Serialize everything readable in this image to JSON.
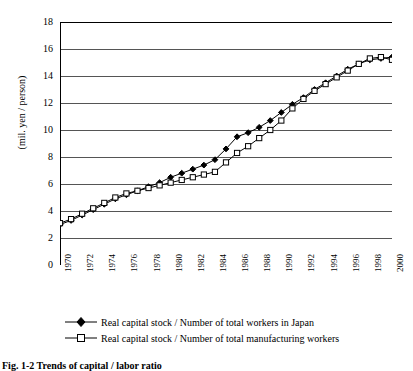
{
  "figure": {
    "caption": "Fig. 1-2  Trends of capital / labor ratio",
    "ylabel": "(mil. yen / person)"
  },
  "legend": {
    "position": "below-axis",
    "items": [
      {
        "label": "Real capital stock / Number of total workers in Japan",
        "marker": "filled-diamond",
        "color": "#000000"
      },
      {
        "label": "Real capital stock / Number of total manufacturing workers",
        "marker": "open-square",
        "color": "#000000"
      }
    ]
  },
  "chart_data": {
    "type": "line",
    "title": "",
    "xlabel": "",
    "ylabel": "(mil. yen / person)",
    "xlim": [
      1970,
      2000
    ],
    "ylim": [
      0,
      18
    ],
    "ytick_step": 2,
    "yticks": [
      0,
      2,
      4,
      6,
      8,
      10,
      12,
      14,
      16,
      18
    ],
    "xticks": [
      1970,
      1972,
      1974,
      1976,
      1978,
      1980,
      1982,
      1984,
      1986,
      1988,
      1990,
      1992,
      1994,
      1996,
      1998,
      2000
    ],
    "xtick_labels": [
      "1970",
      "1972",
      "1974",
      "1976",
      "1978",
      "1980",
      "1982",
      "1984",
      "1986",
      "1988",
      "1990",
      "1992",
      "1994",
      "1996",
      "1998",
      "2000"
    ],
    "minor_xticks_every": 1,
    "grid": "horizontal",
    "x": [
      1970,
      1971,
      1972,
      1973,
      1974,
      1975,
      1976,
      1977,
      1978,
      1979,
      1980,
      1981,
      1982,
      1983,
      1984,
      1985,
      1986,
      1987,
      1988,
      1989,
      1990,
      1991,
      1992,
      1993,
      1994,
      1995,
      1996,
      1997,
      1998,
      1999,
      2000
    ],
    "series": [
      {
        "name": "Real capital stock / Number of total workers in Japan",
        "marker": "filled-diamond",
        "color": "#000000",
        "values": [
          3.0,
          3.3,
          3.7,
          4.1,
          4.5,
          4.9,
          5.2,
          5.5,
          5.8,
          6.1,
          6.5,
          6.8,
          7.1,
          7.4,
          7.8,
          8.6,
          9.5,
          9.8,
          10.2,
          10.7,
          11.3,
          11.9,
          12.4,
          13.0,
          13.5,
          14.0,
          14.5,
          14.9,
          15.2,
          15.3,
          15.4
        ]
      },
      {
        "name": "Real capital stock / Number of total manufacturing workers",
        "marker": "open-square",
        "color": "#000000",
        "values": [
          3.1,
          3.4,
          3.8,
          4.2,
          4.6,
          5.0,
          5.3,
          5.5,
          5.7,
          5.9,
          6.1,
          6.3,
          6.5,
          6.7,
          6.9,
          7.6,
          8.3,
          8.8,
          9.4,
          10.0,
          10.7,
          11.6,
          12.3,
          12.9,
          13.4,
          13.9,
          14.4,
          14.9,
          15.3,
          15.4,
          15.2
        ]
      }
    ]
  }
}
